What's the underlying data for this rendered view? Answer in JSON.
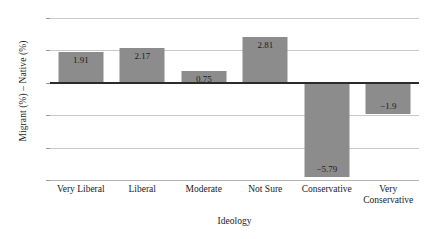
{
  "chart_data": {
    "type": "bar",
    "title": "",
    "xlabel": "Ideology",
    "ylabel": "Migrant (%) – Native (%)",
    "categories": [
      "Very Liberal",
      "Liberal",
      "Moderate",
      "Not Sure",
      "Conservative",
      "Very Conservative"
    ],
    "values": [
      1.91,
      2.17,
      0.75,
      2.81,
      -5.79,
      -1.9
    ],
    "data_labels": [
      "1.91",
      "2.17",
      "0.75",
      "2.81",
      "−5.79",
      "−1.9"
    ],
    "ylim": [
      -6,
      4
    ],
    "yticks": [
      4,
      2,
      0,
      -2,
      -4,
      -6
    ],
    "ytick_labels": [
      "4",
      "2",
      "0",
      "−2",
      "−4",
      "−6"
    ],
    "grid": "horizontal",
    "legend": "none",
    "bar_color": "#8c8c8c",
    "grid_color": "#c9c9c9",
    "zero_line_color": "#2b2b2b"
  }
}
